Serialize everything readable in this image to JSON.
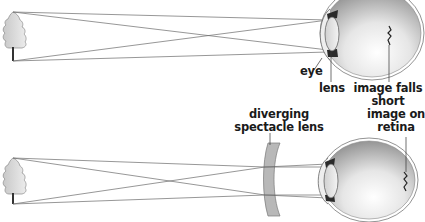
{
  "title_clipped": "",
  "top_diagram": {
    "name": "short-sighted eye without correction",
    "labels": {
      "eye": "eye",
      "lens": "lens",
      "image_line1": "image falls",
      "image_line2": "short"
    }
  },
  "bottom_diagram": {
    "name": "short-sighted eye corrected with diverging lens",
    "labels": {
      "spectacle_line1": "diverging",
      "spectacle_line2": "spectacle lens",
      "image_line1": "image on",
      "image_line2": "retina"
    }
  },
  "colors": {
    "ray": "#6a6a6a",
    "eye_outline": "#777777",
    "eye_fill_dark": "#9a9a9a",
    "eye_fill_light": "#f2f2f2",
    "tree_fill": "#d9d9d9",
    "tree_outline": "#8a8a8a",
    "spectacle_fill": "#b5b5b5",
    "text": "#1a1a1a"
  }
}
